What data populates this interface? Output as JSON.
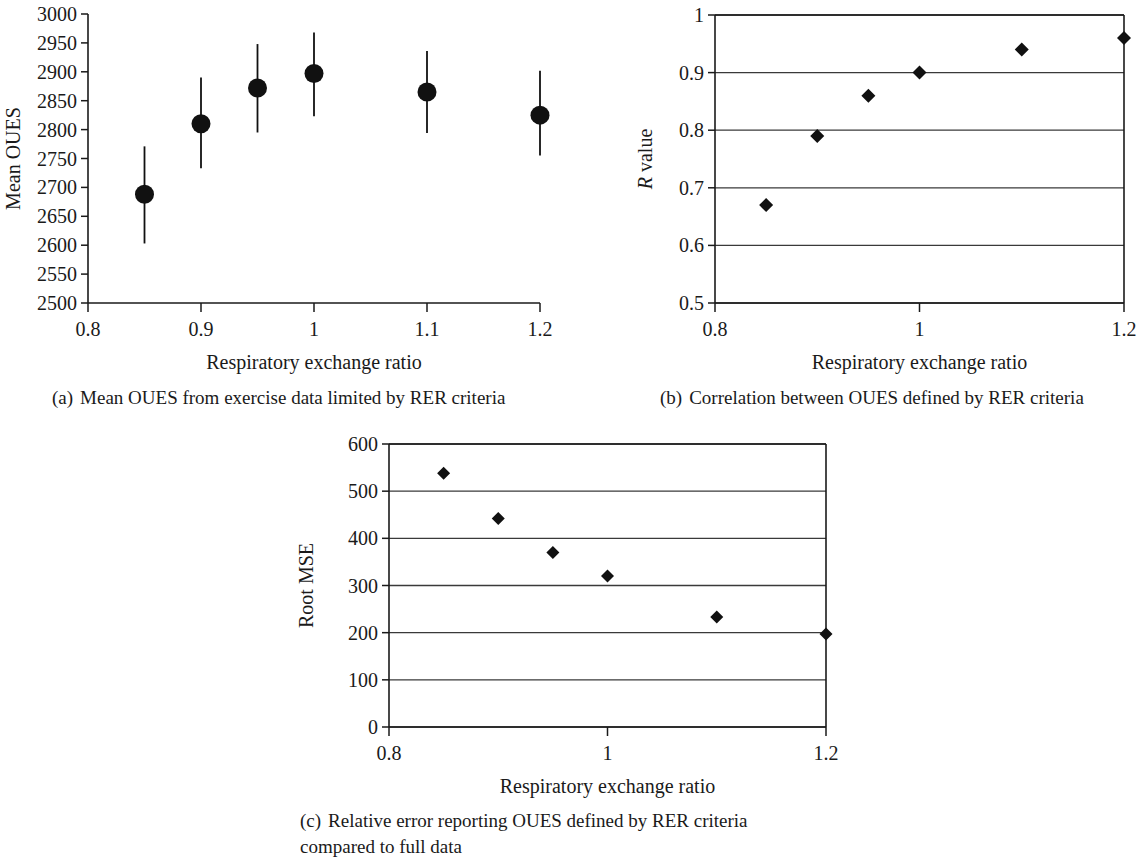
{
  "figure": {
    "panels": [
      "a",
      "b",
      "c"
    ]
  },
  "captions": {
    "a": {
      "tag": "(a)",
      "text": "Mean OUES from exercise data limited by RER criteria"
    },
    "b": {
      "tag": "(b)",
      "text": "Correlation between OUES defined by RER criteria"
    },
    "c": {
      "tag": "(c)",
      "line1": "Relative error reporting OUES defined by RER criteria",
      "line2": "compared to full data"
    }
  },
  "chart_data": [
    {
      "panel": "a",
      "type": "scatter",
      "title": "",
      "xlabel": "Respiratory exchange ratio",
      "ylabel": "Mean OUES",
      "xlim": [
        0.8,
        1.2
      ],
      "ylim": [
        2500,
        3000
      ],
      "xticks": [
        0.8,
        0.9,
        1,
        1.1,
        1.2
      ],
      "xtick_labels": [
        "0.8",
        "0.9",
        "1",
        "1.1",
        "1.2"
      ],
      "yticks": [
        2500,
        2550,
        2600,
        2650,
        2700,
        2750,
        2800,
        2850,
        2900,
        2950,
        3000
      ],
      "ytick_labels": [
        "2500",
        "2550",
        "2600",
        "2650",
        "2700",
        "2750",
        "2800",
        "2850",
        "2900",
        "2950",
        "3000"
      ],
      "grid": false,
      "legend": null,
      "marker": "circle",
      "errorbars": true,
      "x": [
        0.85,
        0.9,
        0.95,
        1.0,
        1.1,
        1.2
      ],
      "values": [
        2688,
        2810,
        2872,
        2897,
        2865,
        2825
      ],
      "err_low": [
        2603,
        2733,
        2795,
        2823,
        2794,
        2755
      ],
      "err_high": [
        2771,
        2890,
        2948,
        2968,
        2936,
        2902
      ]
    },
    {
      "panel": "b",
      "type": "scatter",
      "title": "",
      "xlabel": "Respiratory exchange ratio",
      "ylabel": "R value",
      "ylabel_italic_prefix": "R",
      "xlim": [
        0.8,
        1.2
      ],
      "ylim": [
        0.5,
        1.0
      ],
      "xticks": [
        0.8,
        1,
        1.2
      ],
      "xtick_labels": [
        "0.8",
        "1",
        "1.2"
      ],
      "yticks": [
        0.5,
        0.6,
        0.7,
        0.8,
        0.9,
        1
      ],
      "ytick_labels": [
        "0.5",
        "0.6",
        "0.7",
        "0.8",
        "0.9",
        "1"
      ],
      "grid": true,
      "legend": null,
      "marker": "diamond",
      "errorbars": false,
      "x": [
        0.85,
        0.9,
        0.95,
        1.0,
        1.1,
        1.2
      ],
      "values": [
        0.67,
        0.79,
        0.86,
        0.9,
        0.94,
        0.96
      ]
    },
    {
      "panel": "c",
      "type": "scatter",
      "title": "",
      "xlabel": "Respiratory exchange ratio",
      "ylabel": "Root MSE",
      "xlim": [
        0.8,
        1.2
      ],
      "ylim": [
        0,
        600
      ],
      "xticks": [
        0.8,
        1,
        1.2
      ],
      "xtick_labels": [
        "0.8",
        "1",
        "1.2"
      ],
      "yticks": [
        0,
        100,
        200,
        300,
        400,
        500,
        600
      ],
      "ytick_labels": [
        "0",
        "100",
        "200",
        "300",
        "400",
        "500",
        "600"
      ],
      "grid": true,
      "legend": null,
      "marker": "diamond",
      "errorbars": false,
      "x": [
        0.85,
        0.9,
        0.95,
        1.0,
        1.1,
        1.2
      ],
      "values": [
        538,
        442,
        370,
        320,
        233,
        197
      ]
    }
  ]
}
